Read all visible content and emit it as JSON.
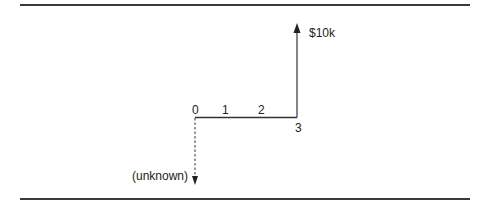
{
  "diagram": {
    "type": "cash-flow-diagram",
    "time_axis": {
      "periods": [
        "0",
        "1",
        "2",
        "3"
      ]
    },
    "cash_flows": [
      {
        "period": "0",
        "direction": "down",
        "label": "(unknown)",
        "style": "dashed"
      },
      {
        "period": "3",
        "direction": "up",
        "label": "$10k",
        "style": "solid"
      }
    ],
    "colors": {
      "line": "#333333",
      "text": "#222222",
      "rule": "#3a3a3a"
    }
  }
}
